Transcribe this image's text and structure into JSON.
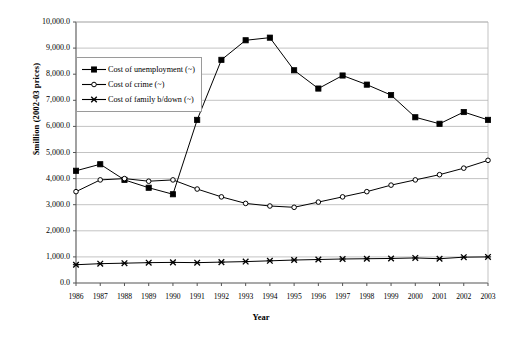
{
  "chart_data": {
    "type": "line",
    "title": "",
    "xlabel": "Year",
    "ylabel": "$million (2002-03 prices)",
    "grid": true,
    "legend_position": "upper-left-inside",
    "ylim": [
      0,
      10000
    ],
    "ytick_labels": [
      "10,000.0",
      "9,000.0",
      "8,000.0",
      "7,000.0",
      "6,000.0",
      "5,000.0",
      "4,000.0",
      "3,000.0",
      "2,000.0",
      "1,000.0",
      "0.0"
    ],
    "ytick_values": [
      10000,
      9000,
      8000,
      7000,
      6000,
      5000,
      4000,
      3000,
      2000,
      1000,
      0
    ],
    "categories": [
      "1986",
      "1987",
      "1988",
      "1989",
      "1990",
      "1991",
      "1992",
      "1993",
      "1994",
      "1995",
      "1996",
      "1997",
      "1998",
      "1999",
      "2000",
      "2001",
      "2002",
      "2003"
    ],
    "x": [
      1986,
      1987,
      1988,
      1989,
      1990,
      1991,
      1992,
      1993,
      1994,
      1995,
      1996,
      1997,
      1998,
      1999,
      2000,
      2001,
      2002,
      2003
    ],
    "series": [
      {
        "name": "Cost of unemployment (~)",
        "marker": "filled-square",
        "values": [
          4300,
          4550,
          3950,
          3650,
          3400,
          6250,
          8550,
          9300,
          9400,
          8150,
          7450,
          7950,
          7600,
          7200,
          6350,
          6100,
          6550,
          6250
        ]
      },
      {
        "name": "Cost of crime (~)",
        "marker": "open-circle",
        "values": [
          3500,
          3950,
          4000,
          3900,
          3950,
          3600,
          3300,
          3050,
          2950,
          2900,
          3100,
          3300,
          3500,
          3750,
          3950,
          4150,
          4400,
          4700
        ]
      },
      {
        "name": "Cost of family b/down (~)",
        "marker": "cross-x",
        "values": [
          700,
          740,
          760,
          780,
          790,
          780,
          800,
          820,
          850,
          880,
          900,
          920,
          930,
          940,
          960,
          930,
          990,
          1000
        ]
      }
    ]
  },
  "colors": {
    "line": "#000000",
    "grid": "#b4b4b4",
    "axis": "#555555",
    "background": "#ffffff"
  }
}
